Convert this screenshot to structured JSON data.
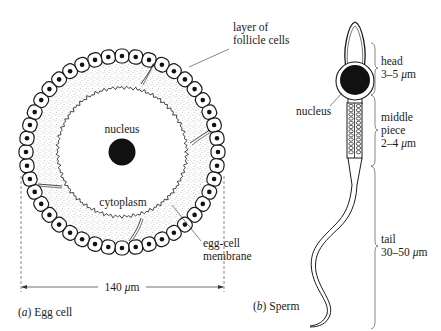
{
  "egg_cell": {
    "caption_letter": "(a)",
    "caption_text": "Egg cell",
    "labels": {
      "follicle_line1": "layer of",
      "follicle_line2": "follicle cells",
      "nucleus": "nucleus",
      "cytoplasm": "cytoplasm",
      "membrane_line1": "egg-cell",
      "membrane_line2": "membrane"
    },
    "dimension": {
      "value": "140",
      "unit_mu": "μ",
      "unit_m": "m"
    }
  },
  "sperm": {
    "caption_letter": "(b)",
    "caption_text": "Sperm",
    "labels": {
      "nucleus": "nucleus",
      "head": "head",
      "head_size": "3–5",
      "middle_line1": "middle",
      "middle_line2": "piece",
      "middle_size": "2–4",
      "tail": "tail",
      "tail_size": "30–50"
    },
    "unit_mu": "μ",
    "unit_m": "m"
  },
  "colors": {
    "ink": "#1a1a1a",
    "stipple": "#8a8a8a",
    "paper": "#ffffff"
  }
}
